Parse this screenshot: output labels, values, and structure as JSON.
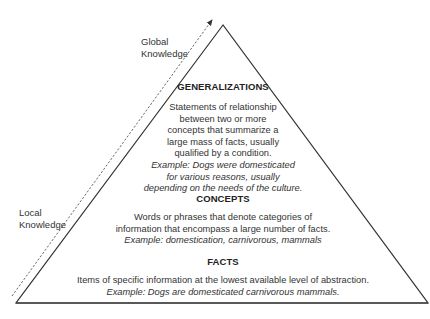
{
  "axis_labels": {
    "top": [
      "Global",
      "Knowledge"
    ],
    "bottom": [
      "Local",
      "Knowledge"
    ]
  },
  "levels": [
    {
      "heading": "GENERALIZATIONS",
      "lines": [
        "Statements of relationship",
        "between two or more",
        "concepts that summarize a",
        "large mass of facts, usually",
        "qualified by a condition."
      ],
      "example_lines": [
        "Example: Dogs were domesticated",
        "for various reasons, usually",
        "depending on the needs of the culture."
      ]
    },
    {
      "heading": "CONCEPTS",
      "lines": [
        "Words or phrases that denote categories of",
        "information that encompass a large number of facts."
      ],
      "example_lines": [
        "Example: domestication, carnivorous, mammals"
      ]
    },
    {
      "heading": "FACTS",
      "lines": [
        "Items of specific information at the lowest available level of abstraction."
      ],
      "example_lines": [
        "Example: Dogs are domesticated carnivorous mammals."
      ]
    }
  ],
  "colors": {
    "line": "#333333",
    "text": "#2a2a2a"
  }
}
